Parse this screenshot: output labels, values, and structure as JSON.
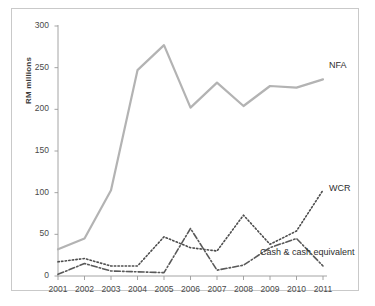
{
  "chart_data": {
    "type": "line",
    "title": "",
    "subtitle": "",
    "xlabel": "",
    "ylabel": "RM millions",
    "categories": [
      "2001",
      "2002",
      "2003",
      "2004",
      "2005",
      "2006",
      "2007",
      "2008",
      "2009",
      "2010",
      "2011"
    ],
    "x": [
      2001,
      2002,
      2003,
      2004,
      2005,
      2006,
      2007,
      2008,
      2009,
      2010,
      2011
    ],
    "ylim": [
      0,
      300
    ],
    "yticks": [
      0,
      50,
      100,
      150,
      200,
      250,
      300
    ],
    "ytick_labels": [
      "0",
      "50",
      "100",
      "150",
      "200",
      "250",
      "300"
    ],
    "grid": false,
    "legend_position": "inline-annotations",
    "series": [
      {
        "name": "NFA",
        "style": "solid",
        "color": "#b3b3b3",
        "width": 2.2,
        "values": [
          32,
          45,
          103,
          247,
          277,
          202,
          232,
          204,
          228,
          226,
          236
        ],
        "label_x": 2011.15,
        "label_y": 252
      },
      {
        "name": "WCR",
        "style": "dotted",
        "color": "#4d4d4d",
        "width": 1.6,
        "values": [
          17,
          21,
          12,
          12,
          47,
          34,
          30,
          73,
          38,
          54,
          103
        ],
        "label_x": 2011.15,
        "label_y": 104
      },
      {
        "name": "Cash & cash equivalent",
        "style": "dashdot",
        "color": "#595959",
        "width": 1.6,
        "values": [
          2,
          15,
          6,
          5,
          4,
          57,
          7,
          13,
          34,
          45,
          12
        ],
        "label_x": 2008.55,
        "label_y": 28
      }
    ],
    "annotations": [
      {
        "text": "NFA",
        "series": "NFA"
      },
      {
        "text": "WCR",
        "series": "WCR"
      },
      {
        "text": "Cash & cash equivalent",
        "series": "Cash & cash equivalent"
      }
    ]
  }
}
